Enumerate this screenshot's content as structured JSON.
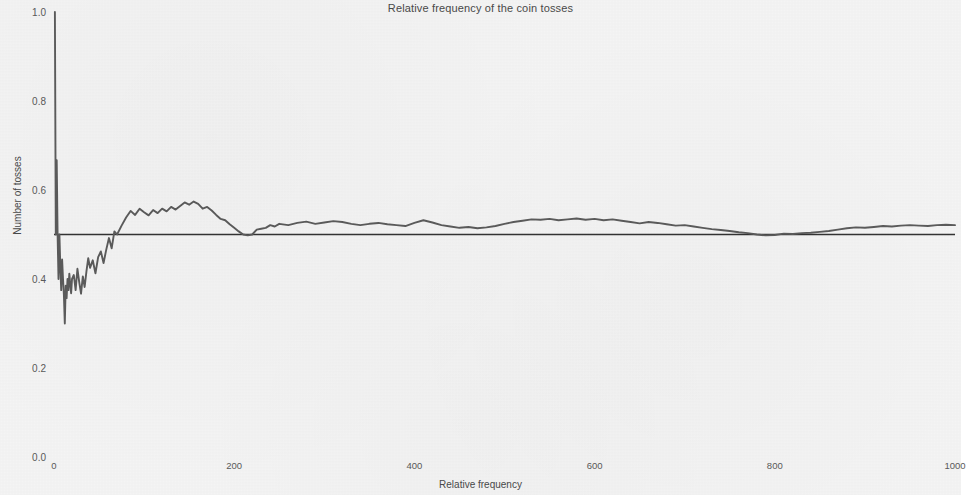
{
  "chart_data": {
    "type": "line",
    "title": "Relative frequency of the coin tosses",
    "xlabel": "Relative frequency",
    "ylabel": "Number of tosses",
    "xlim": [
      0,
      1000
    ],
    "ylim": [
      0.0,
      1.0
    ],
    "grid": false,
    "legend": null,
    "xticks": [
      0,
      200,
      400,
      600,
      800,
      1000
    ],
    "xtick_labels": [
      "0",
      "200",
      "400",
      "600",
      "800",
      "1000"
    ],
    "yticks": [
      0.0,
      0.2,
      0.4,
      0.6,
      0.8,
      1.0
    ],
    "ytick_labels": [
      "0.0",
      "0.2",
      "0.4",
      "0.6",
      "0.8",
      "1.0"
    ],
    "colors": {
      "line": "#5c5c5c",
      "reference_line": "#333333",
      "background": "#f4f4f4",
      "text": "#4a4a4a"
    },
    "annotations": [
      {
        "name": "reference-line",
        "type": "hline",
        "y": 0.5,
        "label": "0.5"
      }
    ],
    "series": [
      {
        "name": "running relative frequency",
        "x": [
          1,
          2,
          3,
          4,
          5,
          6,
          7,
          8,
          9,
          10,
          11,
          12,
          13,
          14,
          15,
          16,
          17,
          18,
          19,
          20,
          22,
          24,
          26,
          28,
          30,
          32,
          34,
          36,
          38,
          40,
          43,
          46,
          49,
          52,
          55,
          58,
          61,
          64,
          67,
          70,
          75,
          80,
          85,
          90,
          95,
          100,
          105,
          110,
          115,
          120,
          125,
          130,
          135,
          140,
          145,
          150,
          155,
          160,
          165,
          170,
          175,
          180,
          185,
          190,
          195,
          200,
          205,
          210,
          215,
          220,
          225,
          230,
          235,
          240,
          245,
          250,
          260,
          270,
          280,
          290,
          300,
          310,
          320,
          330,
          340,
          350,
          360,
          370,
          380,
          390,
          400,
          410,
          420,
          430,
          440,
          450,
          460,
          470,
          480,
          490,
          500,
          510,
          520,
          530,
          540,
          550,
          560,
          570,
          580,
          590,
          600,
          610,
          620,
          630,
          640,
          650,
          660,
          670,
          680,
          690,
          700,
          710,
          720,
          730,
          740,
          750,
          760,
          770,
          780,
          790,
          800,
          810,
          820,
          830,
          840,
          850,
          860,
          870,
          880,
          890,
          900,
          910,
          920,
          930,
          940,
          950,
          960,
          970,
          980,
          990,
          1000
        ],
        "y": [
          1.0,
          0.5,
          0.667,
          0.5,
          0.4,
          0.5,
          0.429,
          0.375,
          0.444,
          0.4,
          0.364,
          0.3,
          0.385,
          0.357,
          0.4,
          0.375,
          0.412,
          0.389,
          0.368,
          0.4,
          0.409,
          0.375,
          0.423,
          0.393,
          0.367,
          0.406,
          0.382,
          0.417,
          0.447,
          0.425,
          0.442,
          0.413,
          0.449,
          0.462,
          0.436,
          0.466,
          0.492,
          0.469,
          0.507,
          0.5,
          0.52,
          0.538,
          0.553,
          0.544,
          0.558,
          0.55,
          0.543,
          0.555,
          0.548,
          0.558,
          0.552,
          0.562,
          0.556,
          0.564,
          0.572,
          0.567,
          0.574,
          0.569,
          0.558,
          0.562,
          0.554,
          0.544,
          0.535,
          0.532,
          0.523,
          0.515,
          0.507,
          0.5,
          0.498,
          0.5,
          0.511,
          0.513,
          0.515,
          0.521,
          0.518,
          0.524,
          0.521,
          0.526,
          0.529,
          0.524,
          0.527,
          0.53,
          0.528,
          0.524,
          0.521,
          0.524,
          0.526,
          0.523,
          0.521,
          0.519,
          0.526,
          0.532,
          0.527,
          0.521,
          0.518,
          0.515,
          0.517,
          0.514,
          0.516,
          0.519,
          0.524,
          0.528,
          0.531,
          0.534,
          0.533,
          0.535,
          0.532,
          0.534,
          0.536,
          0.533,
          0.535,
          0.532,
          0.534,
          0.531,
          0.528,
          0.525,
          0.528,
          0.526,
          0.523,
          0.52,
          0.521,
          0.518,
          0.515,
          0.512,
          0.51,
          0.508,
          0.505,
          0.503,
          0.5,
          0.498,
          0.499,
          0.502,
          0.501,
          0.503,
          0.504,
          0.506,
          0.508,
          0.511,
          0.514,
          0.516,
          0.515,
          0.517,
          0.519,
          0.518,
          0.52,
          0.521,
          0.52,
          0.519,
          0.521,
          0.522,
          0.521
        ]
      }
    ]
  }
}
